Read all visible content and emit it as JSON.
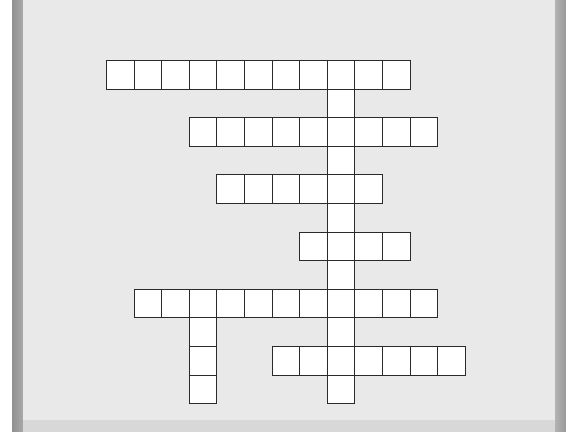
{
  "puzzle": {
    "type": "crossword",
    "origin": {
      "x": 106,
      "y": 60
    },
    "cell_w": 27.6,
    "cell_h": 28.6,
    "colors": {
      "background": "#e9e9e9",
      "cell": "#ffffff",
      "line": "#2a2a2a",
      "bevel": "#999999"
    },
    "words": [
      {
        "id": "across-1",
        "dir": "across",
        "row": 0,
        "col": 0,
        "length": 11
      },
      {
        "id": "across-2",
        "dir": "across",
        "row": 2,
        "col": 3,
        "length": 9
      },
      {
        "id": "across-3",
        "dir": "across",
        "row": 4,
        "col": 4,
        "length": 6
      },
      {
        "id": "across-4",
        "dir": "across",
        "row": 6,
        "col": 7,
        "length": 4
      },
      {
        "id": "across-5",
        "dir": "across",
        "row": 8,
        "col": 1,
        "length": 11
      },
      {
        "id": "across-6",
        "dir": "across",
        "row": 10,
        "col": 6,
        "length": 7
      },
      {
        "id": "down-1",
        "dir": "down",
        "row": 0,
        "col": 8,
        "length": 12
      },
      {
        "id": "down-2",
        "dir": "down",
        "row": 8,
        "col": 3,
        "length": 4
      }
    ]
  }
}
